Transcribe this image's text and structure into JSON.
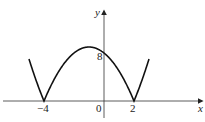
{
  "chart_data": {
    "type": "line",
    "title": "",
    "function": "y = |x^2 + 2x - 8|",
    "xlabel": "x",
    "ylabel": "y",
    "x_ticks": [
      "-4",
      "0",
      "2"
    ],
    "y_ticks": [
      "8"
    ],
    "x_range": [
      -5,
      3
    ],
    "key_points": [
      {
        "x": -4,
        "y": 0,
        "label": "-4"
      },
      {
        "x": 2,
        "y": 0,
        "label": "2"
      },
      {
        "x": 0,
        "y": 8,
        "label": "8"
      },
      {
        "x": -1,
        "y": 9
      }
    ],
    "grid": false,
    "legend": null
  },
  "labels": {
    "x_axis": "x",
    "y_axis": "y",
    "origin": "0",
    "x_neg4": "−4",
    "x_2": "2",
    "y_8": "8"
  }
}
